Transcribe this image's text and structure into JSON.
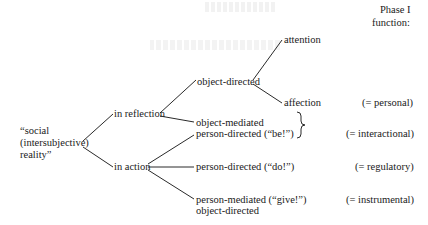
{
  "header": {
    "phase_line1": "Phase I",
    "phase_line2": "function:"
  },
  "root": {
    "line1": "“social",
    "line2": "(intersubjective)",
    "line3": "reality”"
  },
  "branches": {
    "reflection": {
      "label": "in reflection",
      "object_directed": {
        "label": "object-directed",
        "children": [
          "attention",
          "affection"
        ]
      },
      "object_mediated": "object-mediated",
      "person_directed_be": "person-directed (“be!”)"
    },
    "action": {
      "label": "in action",
      "person_directed_do": "person-directed (“do!”)",
      "person_mediated_give": "person-mediated (“give!”)",
      "object_directed": "object-directed"
    }
  },
  "functions": {
    "personal": "(= personal)",
    "interactional": "(= interactional)",
    "regulatory": "(= regulatory)",
    "instrumental": "(= instrumental)"
  },
  "brace_symbol": "}"
}
